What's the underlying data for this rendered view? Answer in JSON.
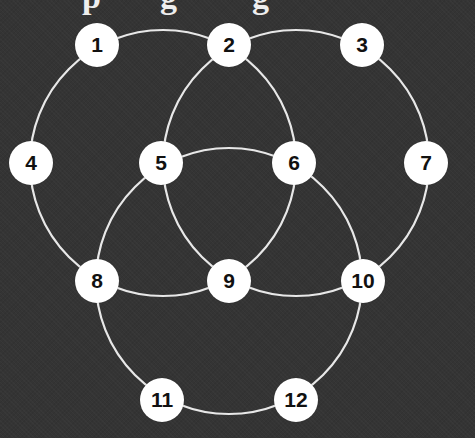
{
  "title_fragment": {
    "text": "p g g",
    "note_visible": "only descenders visible at top edge"
  },
  "colors": {
    "background": "#343434",
    "edge": "#e8e8e8",
    "node_fill": "#ffffff",
    "node_text": "#111111"
  },
  "circles": [
    {
      "name": "left",
      "cx": 163,
      "cy": 163,
      "r": 133
    },
    {
      "name": "right",
      "cx": 296,
      "cy": 163,
      "r": 133
    },
    {
      "name": "bottom",
      "cx": 229,
      "cy": 281,
      "r": 133
    }
  ],
  "nodes": [
    {
      "label": "1",
      "x": 97,
      "y": 45
    },
    {
      "label": "2",
      "x": 229,
      "y": 45
    },
    {
      "label": "3",
      "x": 362,
      "y": 45
    },
    {
      "label": "4",
      "x": 31,
      "y": 163
    },
    {
      "label": "5",
      "x": 161,
      "y": 163
    },
    {
      "label": "6",
      "x": 294,
      "y": 163
    },
    {
      "label": "7",
      "x": 426,
      "y": 163
    },
    {
      "label": "8",
      "x": 97,
      "y": 281
    },
    {
      "label": "9",
      "x": 229,
      "y": 281
    },
    {
      "label": "10",
      "x": 363,
      "y": 281
    },
    {
      "label": "11",
      "x": 162,
      "y": 400
    },
    {
      "label": "12",
      "x": 296,
      "y": 400
    }
  ]
}
